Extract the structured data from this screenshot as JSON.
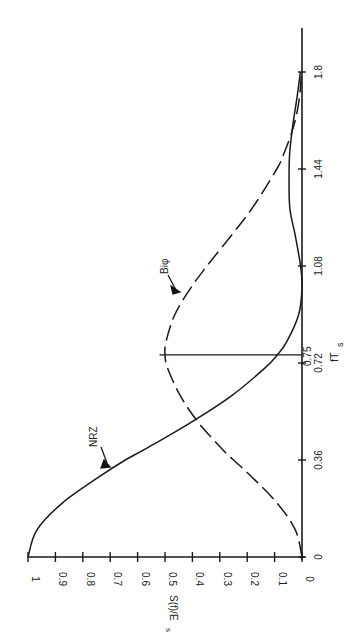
{
  "chart_data": {
    "type": "line",
    "title": "",
    "orientation": "rotated 90 degrees counter-clockwise (x-axis vertical, y-axis horizontal)",
    "xlabel": "fT_s",
    "ylabel": "S(f)/E_s",
    "xlim": [
      0,
      1.9
    ],
    "ylim": [
      0,
      1
    ],
    "x_ticks": [
      0,
      0.36,
      0.72,
      1.08,
      1.44,
      1.8
    ],
    "x_tick_labels": [
      "0",
      "0.36",
      "0.72",
      "1.08",
      "1.44",
      "1.8"
    ],
    "y_ticks": [
      0,
      0.1,
      0.2,
      0.3,
      0.4,
      0.5,
      0.6,
      0.7,
      0.8,
      0.9,
      1
    ],
    "y_tick_labels": [
      "0",
      "0.1",
      "0.2",
      "0.3",
      "0.4",
      "0.5",
      "0.6",
      "0.7",
      "0.8",
      "0.9",
      "1"
    ],
    "grid": false,
    "annotations": [
      {
        "text": "NRZ",
        "points_to": "NRZ curve near fT_s = 0.33"
      },
      {
        "text": "Biφ",
        "points_to": "Biφ curve near fT_s = 0.95"
      },
      {
        "text": "0.75",
        "note": "vertical marker line at fT_s = 0.75 from axis to Biφ peak"
      }
    ],
    "marker_line": {
      "x": 0.75,
      "y_top": 0.52
    },
    "x": [
      0,
      0.1,
      0.2,
      0.3,
      0.36,
      0.4,
      0.5,
      0.6,
      0.7,
      0.75,
      0.8,
      0.9,
      1.0,
      1.08,
      1.2,
      1.3,
      1.44,
      1.5,
      1.6,
      1.7,
      1.8
    ],
    "series": [
      {
        "name": "NRZ",
        "style": "solid",
        "values": [
          1.0,
          0.968,
          0.875,
          0.737,
          0.645,
          0.573,
          0.405,
          0.255,
          0.137,
          0.09,
          0.055,
          0.012,
          0.0,
          0.005,
          0.026,
          0.045,
          0.047,
          0.045,
          0.034,
          0.019,
          0.006
        ]
      },
      {
        "name": "Biφ",
        "style": "dashed",
        "values": [
          0.0,
          0.024,
          0.091,
          0.186,
          0.25,
          0.291,
          0.379,
          0.445,
          0.49,
          0.5,
          0.496,
          0.464,
          0.405,
          0.347,
          0.253,
          0.178,
          0.092,
          0.065,
          0.03,
          0.01,
          0.002
        ]
      }
    ]
  },
  "labels": {
    "nrz": "NRZ",
    "biphi": "Biφ",
    "xlabel_main": "fT",
    "xlabel_sub": "s",
    "ylabel_main": "S(f)/E",
    "ylabel_sub": "s",
    "marker_value": "0.75"
  }
}
